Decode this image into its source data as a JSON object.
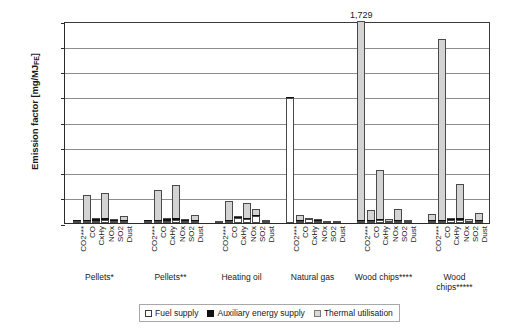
{
  "chart_data": {
    "type": "bar",
    "title": "",
    "subtitle": "",
    "xlabel": "",
    "ylabel": "Emission factor [mg/MJ",
    "ylabel_sub": "FE",
    "ylabel_suffix": "]",
    "ylim": [
      0,
      800
    ],
    "ytick_values": [
      0,
      100,
      200,
      300,
      400,
      500,
      600,
      700,
      800
    ],
    "ytick_labels": [
      "0",
      "100",
      "200",
      "300",
      "400",
      "500",
      "600",
      "700",
      "800"
    ],
    "grid": true,
    "stacked": true,
    "legend_position": "bottom",
    "legend": [
      {
        "name": "Fuel supply",
        "color": "#ffffff"
      },
      {
        "name": "Auxiliary energy supply",
        "color": "#111111"
      },
      {
        "name": "Thermal utilisation",
        "color": "#d9d9d9"
      }
    ],
    "series": [
      {
        "name": "Fuel supply",
        "key": "fuel",
        "color": "#ffffff"
      },
      {
        "name": "Auxiliary energy supply",
        "key": "aux",
        "color": "#111111"
      },
      {
        "name": "Thermal utilisation",
        "key": "thermal",
        "color": "#d9d9d9"
      }
    ],
    "categories": [
      "CO2***",
      "CO",
      "CxHy",
      "NOx",
      "SO2",
      "Dust"
    ],
    "groups": [
      {
        "label": "Pellets*",
        "label_lines": [
          "Pellets*"
        ],
        "bars": [
          {
            "category": "CO2***",
            "fuel": 8,
            "aux": 3,
            "thermal": 0,
            "total": 11
          },
          {
            "category": "CO",
            "fuel": 8,
            "aux": 4,
            "thermal": 98,
            "total": 110
          },
          {
            "category": "CxHy",
            "fuel": 10,
            "aux": 5,
            "thermal": 3,
            "total": 18
          },
          {
            "category": "NOx",
            "fuel": 13,
            "aux": 5,
            "thermal": 100,
            "total": 118
          },
          {
            "category": "SO2",
            "fuel": 6,
            "aux": 4,
            "thermal": 4,
            "total": 14
          },
          {
            "category": "Dust",
            "fuel": 2,
            "aux": 1,
            "thermal": 24,
            "total": 27
          }
        ]
      },
      {
        "label": "Pellets**",
        "label_lines": [
          "Pellets**"
        ],
        "bars": [
          {
            "category": "CO2***",
            "fuel": 7,
            "aux": 3,
            "thermal": 0,
            "total": 10
          },
          {
            "category": "CO",
            "fuel": 8,
            "aux": 5,
            "thermal": 117,
            "total": 130
          },
          {
            "category": "CxHy",
            "fuel": 10,
            "aux": 5,
            "thermal": 3,
            "total": 18
          },
          {
            "category": "NOx",
            "fuel": 13,
            "aux": 5,
            "thermal": 132,
            "total": 150
          },
          {
            "category": "SO2",
            "fuel": 6,
            "aux": 4,
            "thermal": 4,
            "total": 14
          },
          {
            "category": "Dust",
            "fuel": 2,
            "aux": 1,
            "thermal": 27,
            "total": 30
          }
        ]
      },
      {
        "label": "Heating oil",
        "label_lines": [
          "Heating oil"
        ],
        "bars": [
          {
            "category": "CO2***",
            "fuel": 8,
            "aux": 1,
            "thermal": 0,
            "total": 9
          },
          {
            "category": "CO",
            "fuel": 6,
            "aux": 2,
            "thermal": 80,
            "total": 88
          },
          {
            "category": "CxHy",
            "fuel": 25,
            "aux": 1,
            "thermal": 2,
            "total": 28
          },
          {
            "category": "NOx",
            "fuel": 18,
            "aux": 2,
            "thermal": 60,
            "total": 80
          },
          {
            "category": "SO2",
            "fuel": 30,
            "aux": 1,
            "thermal": 26,
            "total": 57
          },
          {
            "category": "Dust",
            "fuel": 2,
            "aux": 1,
            "thermal": 4,
            "total": 7
          }
        ]
      },
      {
        "label": "Natural gas",
        "label_lines": [
          "Natural gas"
        ],
        "bars": [
          {
            "category": "CO2***",
            "fuel": 495,
            "aux": 5,
            "thermal": 0,
            "total": 500
          },
          {
            "category": "CO",
            "fuel": 6,
            "aux": 2,
            "thermal": 22,
            "total": 30
          },
          {
            "category": "CxHy",
            "fuel": 19,
            "aux": 1,
            "thermal": 1,
            "total": 21
          },
          {
            "category": "NOx",
            "fuel": 9,
            "aux": 2,
            "thermal": 6,
            "total": 17
          },
          {
            "category": "SO2",
            "fuel": 4,
            "aux": 1,
            "thermal": 0,
            "total": 5
          },
          {
            "category": "Dust",
            "fuel": 1,
            "aux": 1,
            "thermal": 0,
            "total": 2
          }
        ]
      },
      {
        "label": "Wood chips****",
        "label_lines": [
          "Wood chips****"
        ],
        "bars": [
          {
            "category": "CO2***",
            "fuel": 6,
            "aux": 4,
            "thermal": 1719,
            "total": 1729,
            "clipped": true,
            "annotation": "1,729"
          },
          {
            "category": "CO",
            "fuel": 8,
            "aux": 5,
            "thermal": 40,
            "total": 53
          },
          {
            "category": "CxHy",
            "fuel": 10,
            "aux": 5,
            "thermal": 195,
            "total": 210
          },
          {
            "category": "NOx",
            "fuel": 5,
            "aux": 3,
            "thermal": 7,
            "total": 15
          },
          {
            "category": "SO2",
            "fuel": 4,
            "aux": 2,
            "thermal": 48,
            "total": 54
          },
          {
            "category": "Dust",
            "fuel": 2,
            "aux": 1,
            "thermal": 4,
            "total": 7
          }
        ]
      },
      {
        "label": "Wood chips*****",
        "label_lines": [
          "Wood",
          "chips*****"
        ],
        "bars": [
          {
            "category": "CO2***",
            "fuel": 6,
            "aux": 4,
            "thermal": 26,
            "total": 36
          },
          {
            "category": "CO",
            "fuel": 8,
            "aux": 5,
            "thermal": 717,
            "total": 730
          },
          {
            "category": "CxHy",
            "fuel": 10,
            "aux": 5,
            "thermal": 5,
            "total": 20
          },
          {
            "category": "NOx",
            "fuel": 13,
            "aux": 5,
            "thermal": 137,
            "total": 155
          },
          {
            "category": "SO2",
            "fuel": 5,
            "aux": 3,
            "thermal": 6,
            "total": 14
          },
          {
            "category": "Dust",
            "fuel": 3,
            "aux": 2,
            "thermal": 33,
            "total": 38
          }
        ]
      }
    ]
  }
}
